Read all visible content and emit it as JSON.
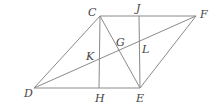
{
  "diagram": {
    "line_color": "#8a8a8a",
    "label_color": "#444444",
    "points": [
      {
        "name": "C",
        "x": 100,
        "y": 16,
        "lx": 88,
        "ly": 16
      },
      {
        "name": "J",
        "x": 139,
        "y": 16,
        "lx": 136,
        "ly": 12
      },
      {
        "name": "F",
        "x": 196,
        "y": 16,
        "lx": 200,
        "ly": 18
      },
      {
        "name": "D",
        "x": 34,
        "y": 88,
        "lx": 24,
        "ly": 97
      },
      {
        "name": "H",
        "x": 99,
        "y": 88,
        "lx": 95,
        "ly": 102
      },
      {
        "name": "E",
        "x": 140,
        "y": 88,
        "lx": 136,
        "ly": 102
      },
      {
        "name": "G",
        "x": 118,
        "y": 50,
        "lx": 116,
        "ly": 46
      },
      {
        "name": "K",
        "x": 99,
        "y": 64,
        "lx": 86,
        "ly": 60
      },
      {
        "name": "L",
        "x": 139,
        "y": 45,
        "lx": 142,
        "ly": 53
      }
    ],
    "segments": [
      [
        "C",
        "F"
      ],
      [
        "D",
        "E"
      ],
      [
        "C",
        "D"
      ],
      [
        "F",
        "E"
      ],
      [
        "C",
        "H"
      ],
      [
        "J",
        "E"
      ],
      [
        "C",
        "E"
      ],
      [
        "D",
        "F"
      ]
    ]
  }
}
